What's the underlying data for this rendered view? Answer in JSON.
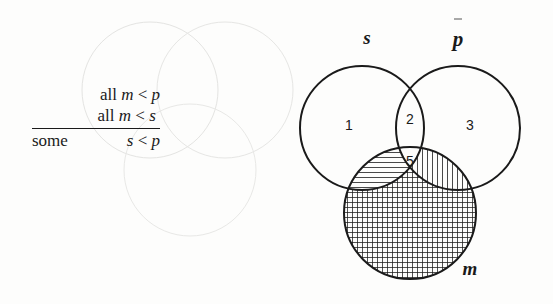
{
  "syllogism": {
    "premise1": {
      "quantifier": "all",
      "subject": "m",
      "relation": "<",
      "predicate": "p"
    },
    "premise2": {
      "quantifier": "all",
      "subject": "m",
      "relation": "<",
      "predicate": "s"
    },
    "conclusion": {
      "quantifier": "some",
      "subject": "s",
      "relation": "<",
      "predicate": "p"
    }
  },
  "venn": {
    "circles": [
      {
        "id": "s",
        "label": "s"
      },
      {
        "id": "p",
        "label": "p"
      },
      {
        "id": "m",
        "label": "m"
      }
    ],
    "regions": [
      {
        "label": "1",
        "description": "s only"
      },
      {
        "label": "2",
        "description": "s and p, not m"
      },
      {
        "label": "3",
        "description": "p only"
      },
      {
        "label": "5",
        "description": "s and p and m"
      }
    ],
    "shading": {
      "s_and_m_not_p": "horizontal",
      "p_and_m_not_s": "vertical",
      "m_only": "crosshatch"
    },
    "stroke_color": "#1a1a1a"
  }
}
